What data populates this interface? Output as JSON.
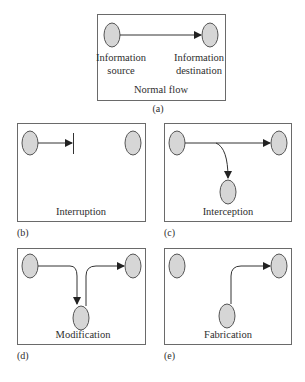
{
  "panels": {
    "a": {
      "tag": "(a)",
      "title": "Normal flow",
      "source_label_1": "Information",
      "source_label_2": "source",
      "dest_label_1": "Information",
      "dest_label_2": "destination"
    },
    "b": {
      "tag": "(b)",
      "title": "Interruption"
    },
    "c": {
      "tag": "(c)",
      "title": "Interception"
    },
    "d": {
      "tag": "(d)",
      "title": "Modification"
    },
    "e": {
      "tag": "(e)",
      "title": "Fabrication"
    }
  },
  "colors": {
    "node_fill": "#d6d6d6",
    "node_stroke": "#555555",
    "box_stroke": "#6a6a6a",
    "arrow": "#333333"
  }
}
